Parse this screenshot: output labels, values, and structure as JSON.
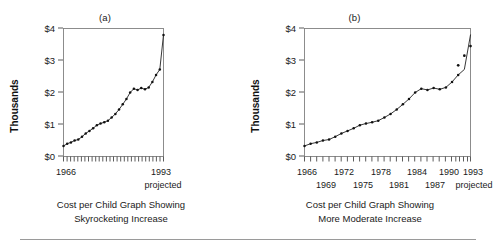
{
  "figure": {
    "panels": [
      {
        "id": "a",
        "label": "(a)",
        "caption_line1": "Cost per Child Graph Showing",
        "caption_line2": "Skyrocketing Increase"
      },
      {
        "id": "b",
        "label": "(b)",
        "caption_line1": "Cost per Child Graph Showing",
        "caption_line2": "More Moderate Increase"
      }
    ],
    "colors": {
      "line": "#202020",
      "dot": "#111111",
      "axis": "#4a4a4a",
      "frame": "#808080",
      "text": "#1a1a1a",
      "rule": "#9a9a9a",
      "background": "#ffffff"
    }
  },
  "chart_data": [
    {
      "type": "line",
      "id": "a",
      "title": "(a)",
      "subtitle": "Cost per Child Graph Showing Skyrocketing Increase",
      "xlabel": "",
      "ylabel": "Thousands",
      "ylim": [
        0,
        4
      ],
      "yticks": [
        0,
        1,
        2,
        3,
        4
      ],
      "yticklabels": [
        "$0",
        "$1",
        "$2",
        "$3",
        "$4"
      ],
      "xlim": [
        1966,
        1993
      ],
      "xticks": [
        1966,
        1993
      ],
      "xticklabels": [
        "1966",
        "1993"
      ],
      "xtick_sublabels": [
        "",
        "projected"
      ],
      "minor_xticks_count": 28,
      "grid": false,
      "legend": null,
      "aspect_note": "narrow horizontal scale exaggerates the slope",
      "x": [
        1966,
        1967,
        1968,
        1969,
        1970,
        1971,
        1972,
        1973,
        1974,
        1975,
        1976,
        1977,
        1978,
        1979,
        1980,
        1981,
        1982,
        1983,
        1984,
        1985,
        1986,
        1987,
        1988,
        1989,
        1990,
        1991,
        1992,
        1993
      ],
      "values": [
        0.33,
        0.4,
        0.44,
        0.5,
        0.53,
        0.62,
        0.72,
        0.8,
        0.88,
        0.98,
        1.03,
        1.07,
        1.12,
        1.22,
        1.33,
        1.47,
        1.63,
        1.8,
        2.0,
        2.12,
        2.08,
        2.14,
        2.1,
        2.16,
        2.33,
        2.55,
        2.72,
        3.8
      ],
      "series": [
        {
          "name": "Cost per child (thousands of dollars)",
          "values": [
            0.33,
            0.4,
            0.44,
            0.5,
            0.53,
            0.62,
            0.72,
            0.8,
            0.88,
            0.98,
            1.03,
            1.07,
            1.12,
            1.22,
            1.33,
            1.47,
            1.63,
            1.8,
            2.0,
            2.12,
            2.08,
            2.14,
            2.1,
            2.16,
            2.33,
            2.55,
            2.72,
            3.8
          ]
        }
      ]
    },
    {
      "type": "line",
      "id": "b",
      "title": "(b)",
      "subtitle": "Cost per Child Graph Showing More Moderate Increase",
      "xlabel": "",
      "ylabel": "Thousands",
      "ylim": [
        0,
        4
      ],
      "yticks": [
        0,
        1,
        2,
        3,
        4
      ],
      "yticklabels": [
        "$0",
        "$1",
        "$2",
        "$3",
        "$4"
      ],
      "xlim": [
        1966,
        1993
      ],
      "xticks": [
        1966,
        1969,
        1972,
        1975,
        1978,
        1981,
        1984,
        1987,
        1990,
        1993
      ],
      "xticklabels_row1": [
        "1966",
        "1972",
        "1978",
        "1984",
        "1990",
        "1993"
      ],
      "xticklabels_row2": [
        "1969",
        "1975",
        "1981",
        "1987",
        "projected"
      ],
      "minor_xticks_count": 28,
      "grid": false,
      "legend": null,
      "aspect_note": "wider horizontal scale flattens the same data",
      "x": [
        1966,
        1967,
        1968,
        1969,
        1970,
        1971,
        1972,
        1973,
        1974,
        1975,
        1976,
        1977,
        1978,
        1979,
        1980,
        1981,
        1982,
        1983,
        1984,
        1985,
        1986,
        1987,
        1988,
        1989,
        1990,
        1991,
        1992,
        1993
      ],
      "values": [
        0.33,
        0.4,
        0.44,
        0.5,
        0.53,
        0.62,
        0.72,
        0.8,
        0.88,
        0.98,
        1.03,
        1.07,
        1.12,
        1.22,
        1.33,
        1.47,
        1.63,
        1.8,
        2.0,
        2.12,
        2.08,
        2.14,
        2.1,
        2.16,
        2.33,
        2.55,
        2.72,
        3.8
      ],
      "projected_points": {
        "x": [
          1991,
          1992,
          1993
        ],
        "values": [
          2.85,
          3.15,
          3.45
        ]
      },
      "series": [
        {
          "name": "Cost per child (thousands of dollars)",
          "values": [
            0.33,
            0.4,
            0.44,
            0.5,
            0.53,
            0.62,
            0.72,
            0.8,
            0.88,
            0.98,
            1.03,
            1.07,
            1.12,
            1.22,
            1.33,
            1.47,
            1.63,
            1.8,
            2.0,
            2.12,
            2.08,
            2.14,
            2.1,
            2.16,
            2.33,
            2.55,
            2.72,
            3.8
          ]
        }
      ]
    }
  ]
}
